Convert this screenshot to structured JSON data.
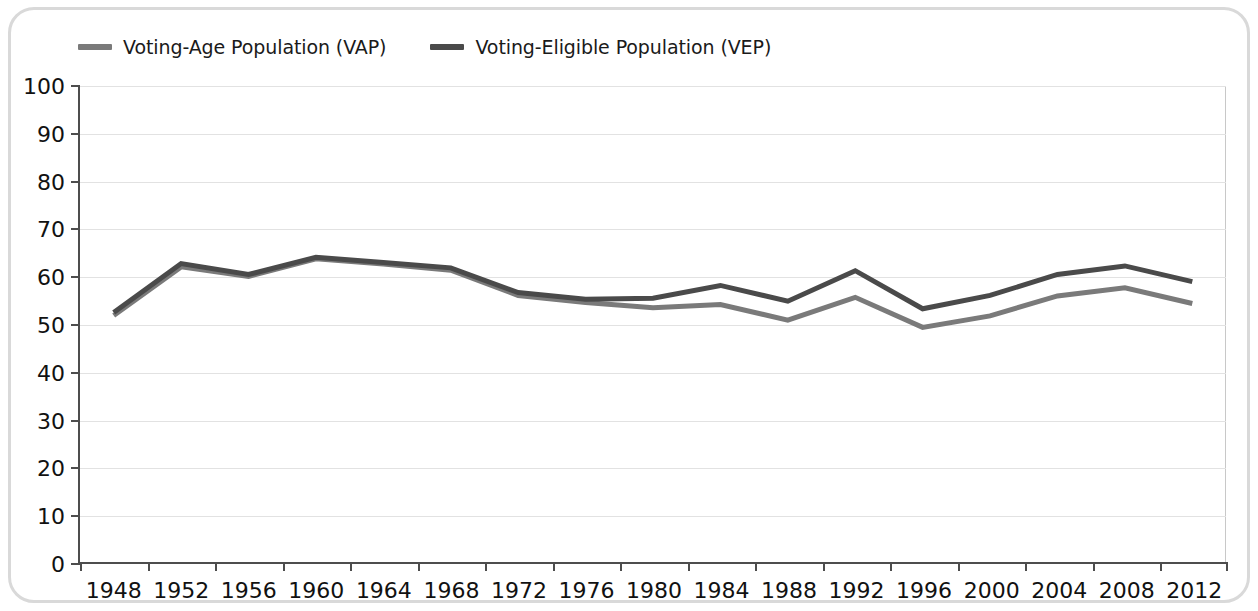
{
  "chart_data": {
    "type": "line",
    "title": "",
    "subtitle": "",
    "xlabel": "",
    "ylabel": "",
    "xlim": [
      1948,
      2012
    ],
    "ylim": [
      0,
      100
    ],
    "grid": true,
    "legend_position": "top-left",
    "x": [
      1948,
      1952,
      1956,
      1960,
      1964,
      1968,
      1972,
      1976,
      1980,
      1984,
      1988,
      1992,
      1996,
      2000,
      2004,
      2008,
      2012
    ],
    "categories": [
      "1948",
      "1952",
      "1956",
      "1960",
      "1964",
      "1968",
      "1972",
      "1976",
      "1980",
      "1984",
      "1988",
      "1992",
      "1996",
      "2000",
      "2004",
      "2008",
      "2012"
    ],
    "ytick_labels": [
      "0",
      "10",
      "20",
      "30",
      "40",
      "50",
      "60",
      "70",
      "80",
      "90",
      "100"
    ],
    "ytick_values": [
      0,
      10,
      20,
      30,
      40,
      50,
      60,
      70,
      80,
      90,
      100
    ],
    "series": [
      {
        "name": "Voting-Age Population (VAP)",
        "key": "vap",
        "color": "#7a7a7a",
        "values": [
          51.8,
          62.0,
          60.0,
          63.7,
          62.6,
          61.3,
          56.0,
          54.5,
          53.4,
          54.1,
          50.8,
          55.6,
          49.3,
          51.7,
          55.9,
          57.6,
          54.3
        ]
      },
      {
        "name": "Voting-Eligible Population (VEP)",
        "key": "vep",
        "color": "#4a4a4a",
        "values": [
          52.4,
          62.7,
          60.4,
          64.0,
          62.9,
          61.8,
          56.6,
          55.2,
          55.4,
          58.1,
          54.8,
          61.2,
          53.2,
          56.0,
          60.4,
          62.2,
          58.9
        ]
      }
    ]
  },
  "legend": {
    "items": [
      {
        "label": "Voting-Age Population (VAP)",
        "color": "#7a7a7a"
      },
      {
        "label": "Voting-Eligible Population (VEP)",
        "color": "#4a4a4a"
      }
    ]
  },
  "colors": {
    "vap": "#7a7a7a",
    "vep": "#4a4a4a",
    "axis": "#4d4d4d",
    "gridline": "#e2e2e2",
    "frame": "#d9d9d9",
    "background": "#ffffff",
    "text": "#111111"
  }
}
